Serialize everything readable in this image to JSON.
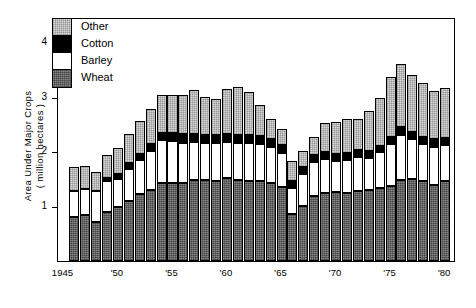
{
  "chart_data": {
    "type": "bar",
    "subtype": "stacked",
    "title": "",
    "xlabel": "",
    "ylabel": "Area Under Major Crops ( million hectares )",
    "ylabel_lines": [
      "Area  Under  Major  Crops",
      "( million  hectares )"
    ],
    "ylim": [
      0,
      4.45
    ],
    "yticks": [
      1,
      2,
      3,
      4
    ],
    "ytick_labels": [
      "1",
      "2",
      "3",
      "4"
    ],
    "xlim": [
      1944.5,
      1981.0
    ],
    "xticks": [
      1945,
      1950,
      1955,
      1960,
      1965,
      1970,
      1975,
      1980
    ],
    "xtick_labels": [
      "1945",
      "'50",
      "'55",
      "'60",
      "'65",
      "'70",
      "'75",
      "'80"
    ],
    "grid": false,
    "legend_position": "upper-left-inside",
    "legend_order_top_to_bottom": [
      "Other",
      "Cotton",
      "Barley",
      "Wheat"
    ],
    "stack_order_bottom_to_top": [
      "Wheat",
      "Barley",
      "Cotton",
      "Other"
    ],
    "series_colors": {
      "Wheat": "#666666",
      "Barley": "#ffffff",
      "Cotton": "#000000",
      "Other": "#d8d8d8"
    },
    "x": [
      1946,
      1947,
      1948,
      1949,
      1950,
      1951,
      1952,
      1953,
      1954,
      1955,
      1956,
      1957,
      1958,
      1959,
      1960,
      1961,
      1962,
      1963,
      1964,
      1965,
      1966,
      1967,
      1968,
      1969,
      1970,
      1971,
      1972,
      1973,
      1974,
      1975,
      1976,
      1977,
      1978,
      1979,
      1980
    ],
    "series": [
      {
        "name": "Wheat",
        "values": [
          0.8,
          0.83,
          0.72,
          0.9,
          0.98,
          1.1,
          1.22,
          1.3,
          1.42,
          1.42,
          1.42,
          1.47,
          1.48,
          1.46,
          1.51,
          1.47,
          1.45,
          1.45,
          1.42,
          1.35,
          0.85,
          1.0,
          1.18,
          1.24,
          1.25,
          1.24,
          1.27,
          1.3,
          1.34,
          1.37,
          1.48,
          1.5,
          1.46,
          1.38,
          1.45
        ]
      },
      {
        "name": "Barley",
        "values": [
          0.48,
          0.48,
          0.55,
          0.55,
          0.52,
          0.58,
          0.62,
          0.7,
          0.78,
          0.76,
          0.74,
          0.7,
          0.68,
          0.7,
          0.66,
          0.68,
          0.7,
          0.68,
          0.66,
          0.62,
          0.48,
          0.58,
          0.62,
          0.62,
          0.58,
          0.6,
          0.62,
          0.58,
          0.64,
          0.76,
          0.82,
          0.72,
          0.68,
          0.7,
          0.66
        ]
      },
      {
        "name": "Cotton",
        "values": [
          0.0,
          0.0,
          0.0,
          0.07,
          0.08,
          0.1,
          0.12,
          0.13,
          0.14,
          0.15,
          0.15,
          0.14,
          0.14,
          0.14,
          0.14,
          0.15,
          0.15,
          0.15,
          0.15,
          0.14,
          0.13,
          0.13,
          0.13,
          0.13,
          0.13,
          0.13,
          0.14,
          0.13,
          0.12,
          0.13,
          0.14,
          0.13,
          0.13,
          0.14,
          0.13
        ]
      },
      {
        "name": "Other",
        "values": [
          0.43,
          0.42,
          0.36,
          0.42,
          0.48,
          0.53,
          0.6,
          0.64,
          0.68,
          0.7,
          0.72,
          0.8,
          0.7,
          0.66,
          0.82,
          0.88,
          0.78,
          0.56,
          0.36,
          0.3,
          0.36,
          0.3,
          0.34,
          0.52,
          0.58,
          0.62,
          0.56,
          0.72,
          0.88,
          1.1,
          1.16,
          1.05,
          0.98,
          0.88,
          0.92
        ]
      }
    ],
    "totals": [
      1.71,
      1.73,
      1.63,
      1.94,
      2.06,
      2.31,
      2.56,
      2.77,
      3.02,
      3.03,
      3.03,
      3.11,
      3.0,
      2.96,
      3.13,
      3.18,
      3.08,
      2.84,
      2.59,
      2.41,
      1.82,
      2.01,
      2.27,
      2.51,
      2.54,
      2.59,
      2.59,
      2.73,
      2.98,
      3.36,
      3.6,
      3.4,
      3.25,
      3.1,
      3.16
    ]
  },
  "legend": {
    "items": [
      {
        "label": "Other",
        "swatch": "other-swatch"
      },
      {
        "label": "Cotton",
        "swatch": "cotton-swatch"
      },
      {
        "label": "Barley",
        "swatch": "barley-swatch"
      },
      {
        "label": "Wheat",
        "swatch": "wheat-swatch"
      }
    ]
  }
}
